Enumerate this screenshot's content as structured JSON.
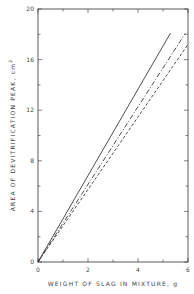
{
  "chart_data": {
    "type": "line",
    "title": "",
    "xlabel": "WEIGHT OF SLAG IN MIXTURE, g",
    "ylabel": "AREA OF DEVITRIFICATION PEAK, cm",
    "ylabel_superscript": "2",
    "xlim": [
      0,
      6
    ],
    "ylim": [
      0,
      20
    ],
    "x_ticks": [
      "0",
      "2",
      "4",
      "6"
    ],
    "y_ticks": [
      "0",
      "4",
      "8",
      "12",
      "16",
      "20"
    ],
    "grid": false,
    "legend": null,
    "series": [
      {
        "name": "solid",
        "style": "solid",
        "x": [
          0,
          5.3
        ],
        "y": [
          0,
          18.1
        ]
      },
      {
        "name": "dash-dot",
        "style": "dashdot",
        "x": [
          0,
          5.9
        ],
        "y": [
          0,
          18.1
        ]
      },
      {
        "name": "dashed",
        "style": "dashed",
        "x": [
          0,
          6.0
        ],
        "y": [
          0,
          17.2
        ]
      }
    ]
  }
}
